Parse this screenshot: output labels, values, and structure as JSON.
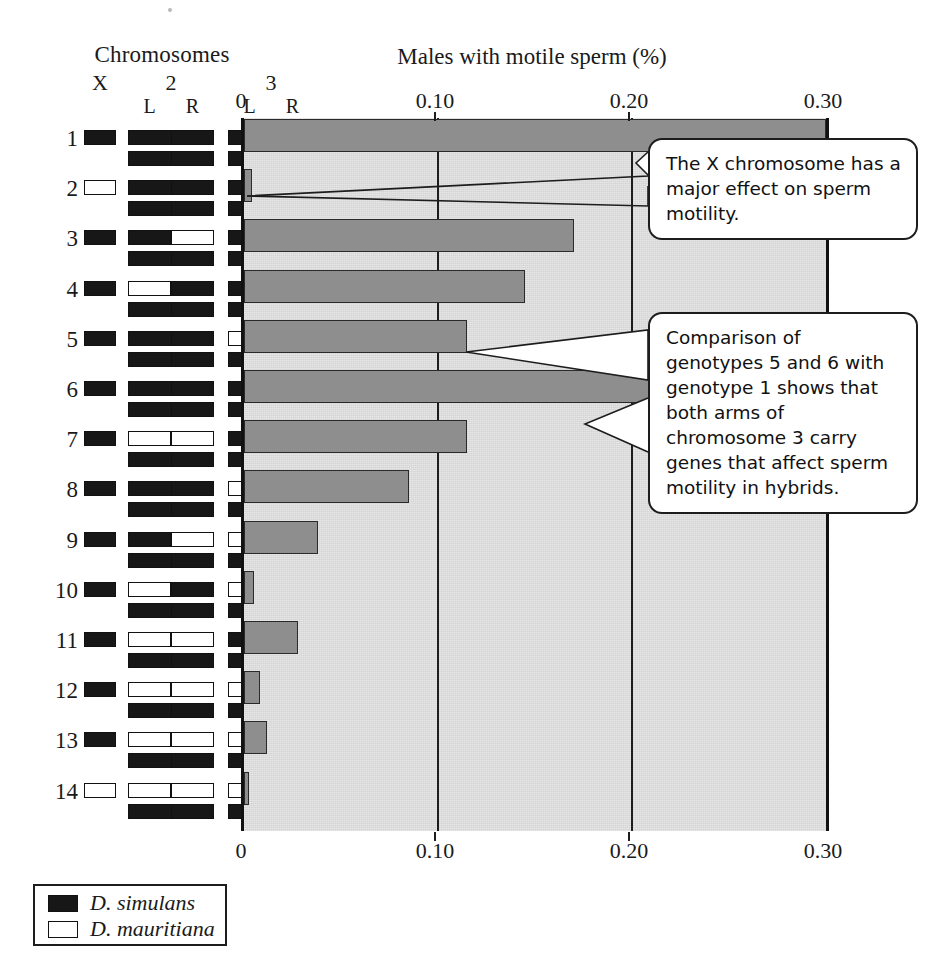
{
  "headings": {
    "chromosomes": "Chromosomes",
    "axis_title": "Males with motile sperm (%)"
  },
  "chromosome_columns": {
    "x_label": "X",
    "chr2_label": "2",
    "chr3_label": "3",
    "arm_left": "L",
    "arm_right": "R"
  },
  "legend": {
    "items": [
      {
        "label": "D. simulans",
        "fill": "black",
        "color": "#171717"
      },
      {
        "label": "D. mauritiana",
        "fill": "white",
        "color": "#ffffff"
      }
    ]
  },
  "callouts": [
    {
      "id": "callout-1",
      "text": "The X chromosome has a major effect on sperm motility."
    },
    {
      "id": "callout-2",
      "text": "Comparison of genotypes 5 and 6 with genotype 1 shows that both arms of chromosome 3 carry genes that affect sperm motility in hybrids."
    }
  ],
  "genotypes": [
    {
      "label": "1",
      "x": "sim",
      "chr2_top": [
        "sim",
        "sim"
      ],
      "chr2_bottom": [
        "sim",
        "sim"
      ],
      "chr3_top": [
        "sim",
        "sim"
      ],
      "chr3_bottom": [
        "sim",
        "sim"
      ]
    },
    {
      "label": "2",
      "x": "mau",
      "chr2_top": [
        "sim",
        "sim"
      ],
      "chr2_bottom": [
        "sim",
        "sim"
      ],
      "chr3_top": [
        "sim",
        "sim"
      ],
      "chr3_bottom": [
        "sim",
        "sim"
      ]
    },
    {
      "label": "3",
      "x": "sim",
      "chr2_top": [
        "sim",
        "mau"
      ],
      "chr2_bottom": [
        "sim",
        "sim"
      ],
      "chr3_top": [
        "sim",
        "sim"
      ],
      "chr3_bottom": [
        "sim",
        "sim"
      ]
    },
    {
      "label": "4",
      "x": "sim",
      "chr2_top": [
        "mau",
        "sim"
      ],
      "chr2_bottom": [
        "sim",
        "sim"
      ],
      "chr3_top": [
        "sim",
        "sim"
      ],
      "chr3_bottom": [
        "sim",
        "sim"
      ]
    },
    {
      "label": "5",
      "x": "sim",
      "chr2_top": [
        "sim",
        "sim"
      ],
      "chr2_bottom": [
        "sim",
        "sim"
      ],
      "chr3_top": [
        "mau",
        "sim"
      ],
      "chr3_bottom": [
        "sim",
        "sim"
      ]
    },
    {
      "label": "6",
      "x": "sim",
      "chr2_top": [
        "sim",
        "sim"
      ],
      "chr2_bottom": [
        "sim",
        "sim"
      ],
      "chr3_top": [
        "sim",
        "mau"
      ],
      "chr3_bottom": [
        "sim",
        "sim"
      ]
    },
    {
      "label": "7",
      "x": "sim",
      "chr2_top": [
        "mau",
        "mau"
      ],
      "chr2_bottom": [
        "sim",
        "sim"
      ],
      "chr3_top": [
        "sim",
        "sim"
      ],
      "chr3_bottom": [
        "sim",
        "sim"
      ]
    },
    {
      "label": "8",
      "x": "sim",
      "chr2_top": [
        "sim",
        "sim"
      ],
      "chr2_bottom": [
        "sim",
        "sim"
      ],
      "chr3_top": [
        "mau",
        "mau"
      ],
      "chr3_bottom": [
        "sim",
        "sim"
      ]
    },
    {
      "label": "9",
      "x": "sim",
      "chr2_top": [
        "sim",
        "mau"
      ],
      "chr2_bottom": [
        "sim",
        "sim"
      ],
      "chr3_top": [
        "mau",
        "mau"
      ],
      "chr3_bottom": [
        "sim",
        "sim"
      ]
    },
    {
      "label": "10",
      "x": "sim",
      "chr2_top": [
        "mau",
        "sim"
      ],
      "chr2_bottom": [
        "sim",
        "sim"
      ],
      "chr3_top": [
        "mau",
        "mau"
      ],
      "chr3_bottom": [
        "sim",
        "sim"
      ]
    },
    {
      "label": "11",
      "x": "sim",
      "chr2_top": [
        "mau",
        "mau"
      ],
      "chr2_bottom": [
        "sim",
        "sim"
      ],
      "chr3_top": [
        "sim",
        "mau"
      ],
      "chr3_bottom": [
        "sim",
        "sim"
      ]
    },
    {
      "label": "12",
      "x": "sim",
      "chr2_top": [
        "mau",
        "mau"
      ],
      "chr2_bottom": [
        "sim",
        "sim"
      ],
      "chr3_top": [
        "mau",
        "sim"
      ],
      "chr3_bottom": [
        "sim",
        "sim"
      ]
    },
    {
      "label": "13",
      "x": "sim",
      "chr2_top": [
        "mau",
        "mau"
      ],
      "chr2_bottom": [
        "sim",
        "sim"
      ],
      "chr3_top": [
        "mau",
        "mau"
      ],
      "chr3_bottom": [
        "sim",
        "sim"
      ]
    },
    {
      "label": "14",
      "x": "mau",
      "chr2_top": [
        "mau",
        "mau"
      ],
      "chr2_bottom": [
        "sim",
        "sim"
      ],
      "chr3_top": [
        "mau",
        "mau"
      ],
      "chr3_bottom": [
        "sim",
        "sim"
      ]
    }
  ],
  "chart_data": {
    "type": "bar",
    "orientation": "horizontal",
    "title": "Males with motile sperm (%)",
    "xlabel": "Males with motile sperm (%)",
    "ylabel": "",
    "categories": [
      "1",
      "2",
      "3",
      "4",
      "5",
      "6",
      "7",
      "8",
      "9",
      "10",
      "11",
      "12",
      "13",
      "14"
    ],
    "values": [
      0.3,
      0.004,
      0.17,
      0.145,
      0.115,
      0.21,
      0.115,
      0.085,
      0.038,
      0.005,
      0.028,
      0.008,
      0.012,
      0.002
    ],
    "xlim": [
      0,
      0.3
    ],
    "xticks": [
      0,
      0.1,
      0.2,
      0.3
    ],
    "xtick_labels": [
      "0",
      "0.10",
      "0.20",
      "0.30"
    ],
    "grid": "vertical gridlines at 0.10 and 0.20",
    "axis_on_top_and_bottom": true,
    "bar_color": "#8e8e8e",
    "plot_background": "#d4d4d4",
    "legend_position": "bottom-left outside"
  }
}
